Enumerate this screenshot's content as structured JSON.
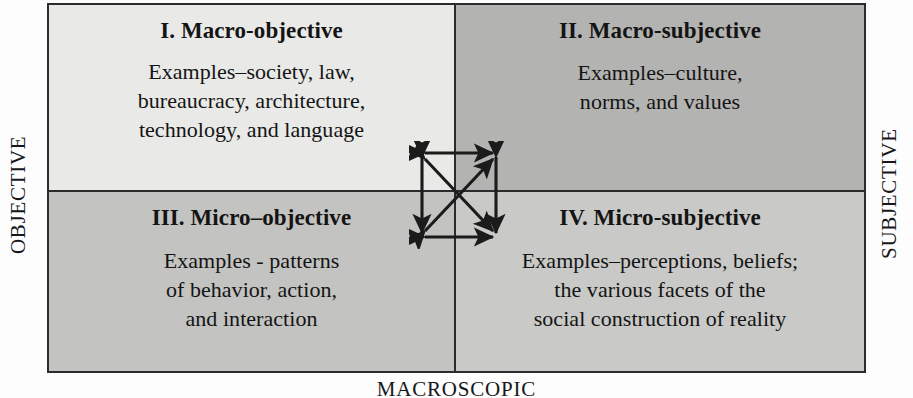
{
  "diagram": {
    "axes": {
      "left_label": "OBJECTIVE",
      "right_label": "SUBJECTIVE",
      "bottom_label": "MACROSCOPIC"
    },
    "quadrants": [
      {
        "id": "q1",
        "title": "I. Macro-objective",
        "lines": [
          "Examples–society, law,",
          "bureaucracy, architecture,",
          "technology, and language"
        ],
        "fill": "#e9e9e7"
      },
      {
        "id": "q2",
        "title": "II. Macro-subjective",
        "lines": [
          "Examples–culture,",
          "norms, and values"
        ],
        "fill": "#b3b3b1"
      },
      {
        "id": "q3",
        "title": "III. Micro–objective",
        "lines": [
          "Examples - patterns",
          "of behavior, action,",
          "and interaction"
        ],
        "fill": "#c3c3c1"
      },
      {
        "id": "q4",
        "title": "IV. Micro-subjective",
        "lines": [
          "Examples–perceptions, beliefs;",
          "the various facets of the",
          "social construction of reality"
        ],
        "fill": "#c9c9c7"
      }
    ],
    "center_connector": {
      "name": "bidirectional-arrow-cluster",
      "description": "Square of four double-headed arrows plus two double-headed diagonals connecting all four quadrants",
      "stroke": "#1b1b1b",
      "arrow_count": 6
    },
    "frame": {
      "border_color": "#2b2b2b",
      "background": "#fdfdfd"
    }
  }
}
